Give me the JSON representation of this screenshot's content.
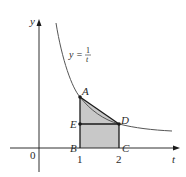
{
  "diagram": {
    "axes": {
      "x_label": "t",
      "y_label": "y",
      "origin_label": "0",
      "ticks": [
        {
          "value": "1",
          "label": "1"
        },
        {
          "value": "2",
          "label": "2"
        }
      ]
    },
    "curve": {
      "equation_lhs": "y =",
      "equation_num": "1",
      "equation_den": "t",
      "color": "#555555"
    },
    "points": [
      {
        "name": "A",
        "label": "A"
      },
      {
        "name": "B",
        "label": "B"
      },
      {
        "name": "C",
        "label": "C"
      },
      {
        "name": "D",
        "label": "D"
      },
      {
        "name": "E",
        "label": "E"
      }
    ],
    "shaded_region": {
      "vertices": [
        "A",
        "B",
        "C",
        "D"
      ],
      "fill": "#c8c8c8"
    },
    "colors": {
      "lines": "#1a1a1a",
      "shade": "#c8c8c8",
      "curve": "#555555"
    }
  }
}
